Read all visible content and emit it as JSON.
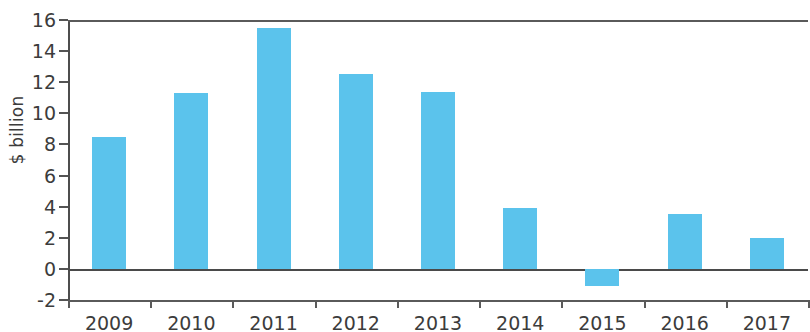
{
  "chart_data": {
    "type": "bar",
    "title": "",
    "subtitle": "",
    "xlabel": "",
    "ylabel": "$ billion",
    "categories": [
      "2009",
      "2010",
      "2011",
      "2012",
      "2013",
      "2014",
      "2015",
      "2016",
      "2017"
    ],
    "values": [
      8.5,
      11.3,
      15.5,
      12.5,
      11.4,
      3.9,
      -1.1,
      3.5,
      2.0
    ],
    "ylim": [
      -2,
      16
    ],
    "yticks": [
      -2,
      0,
      2,
      4,
      6,
      8,
      10,
      12,
      14,
      16
    ],
    "ytick_labels": [
      "-2",
      "0",
      "2",
      "4",
      "6",
      "8",
      "10",
      "12",
      "14",
      "16"
    ],
    "grid": false,
    "legend": null,
    "bar_color": "#5bc3ec",
    "axis_color": "#4d4d4d",
    "text_color": "#3c3c3c",
    "zero_line": 0,
    "series": [
      {
        "name": "",
        "values": [
          8.5,
          11.3,
          15.5,
          12.5,
          11.4,
          3.9,
          -1.1,
          3.5,
          2.0
        ]
      }
    ]
  }
}
